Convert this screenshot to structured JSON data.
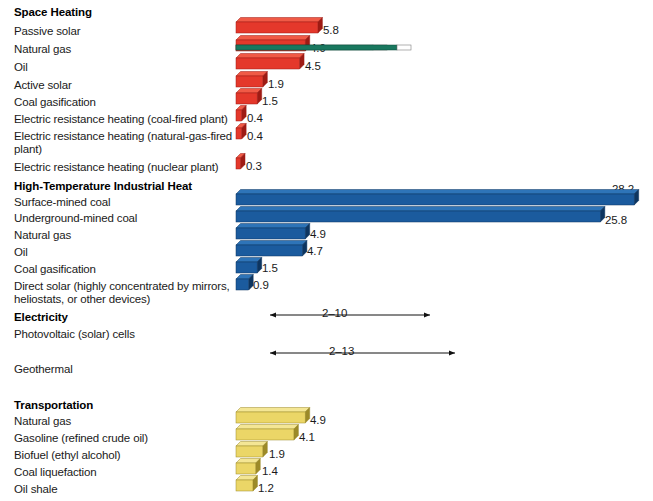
{
  "figure": {
    "title": "",
    "bar_start_x": 236,
    "px_per_unit": 14.12
  },
  "chart_data": {
    "type": "bar",
    "orientation": "horizontal",
    "title": "",
    "xlabel": "",
    "ylabel": "",
    "grid": false,
    "legend": "none",
    "xlim": [
      0,
      28.2
    ],
    "groups": [
      {
        "name": "Space Heating",
        "color": "#E4382B",
        "categories": [
          "Passive solar",
          "Natural gas",
          "Oil",
          "Active solar",
          "Coal gasification",
          "Electric resistance heating (coal-fired plant)",
          "Electric resistance heating (natural-gas-fired plant)",
          "Electric resistance heating (nuclear plant)"
        ],
        "values": [
          5.8,
          4.9,
          4.5,
          1.9,
          1.5,
          0.4,
          0.4,
          0.3
        ],
        "value_labels": [
          "5.8",
          "4.9",
          "4.5",
          "1.9",
          "1.5",
          "0.4",
          "0.4",
          "0.3"
        ]
      },
      {
        "name": "High-Temperature Industrial Heat",
        "color": "#1B5B9E",
        "categories": [
          "Surface-mined coal",
          "Underground-mined coal",
          "Natural gas",
          "Oil",
          "Coal gasification",
          "Direct solar (highly concentrated by mirrors, heliostats, or other devices)"
        ],
        "values": [
          28.2,
          25.8,
          4.9,
          4.7,
          1.5,
          0.9
        ],
        "value_labels": [
          "28.2",
          "25.8",
          "4.9",
          "4.7",
          "1.5",
          "0.9"
        ]
      },
      {
        "name": "Electricity",
        "color": "#19785F",
        "range_fill": "#ffffff",
        "categories": [
          "Photovoltaic (solar) cells",
          "Geothermal"
        ],
        "ranges": [
          [
            2,
            10
          ],
          [
            2,
            13
          ]
        ],
        "range_labels": [
          "2–10",
          "2–13"
        ]
      },
      {
        "name": "Transportation",
        "color": "#EBD667",
        "categories": [
          "Natural gas",
          "Gasoline (refined crude oil)",
          "Biofuel (ethyl alcohol)",
          "Coal liquefaction",
          "Oil shale"
        ],
        "values": [
          4.9,
          4.1,
          1.9,
          1.4,
          1.2
        ],
        "value_labels": [
          "4.9",
          "4.1",
          "1.9",
          "1.4",
          "1.2"
        ]
      }
    ]
  },
  "sections": {
    "space_heating": {
      "title": "Space Heating",
      "rows": [
        {
          "label": "Passive solar",
          "value": "5.8"
        },
        {
          "label": "Natural gas",
          "value": "4.9"
        },
        {
          "label": "Oil",
          "value": "4.5"
        },
        {
          "label": "Active solar",
          "value": "1.9"
        },
        {
          "label": "Coal gasification",
          "value": "1.5"
        },
        {
          "label": "Electric resistance heating (coal-fired plant)",
          "value": "0.4"
        },
        {
          "label": "Electric resistance heating (natural-gas-fired plant)",
          "value": "0.4"
        },
        {
          "label": "Electric resistance heating (nuclear plant)",
          "value": "0.3"
        }
      ]
    },
    "industrial_heat": {
      "title": "High-Temperature Industrial Heat",
      "rows": [
        {
          "label": "Surface-mined coal",
          "value": "28.2"
        },
        {
          "label": "Underground-mined coal",
          "value": "25.8"
        },
        {
          "label": "Natural gas",
          "value": "4.9"
        },
        {
          "label": "Oil",
          "value": "4.7"
        },
        {
          "label": "Coal gasification",
          "value": "1.5"
        },
        {
          "label": "Direct solar (highly concentrated by mirrors, heliostats, or other devices)",
          "value": "0.9"
        }
      ]
    },
    "electricity": {
      "title": "Electricity",
      "rows": [
        {
          "label": "Photovoltaic (solar) cells",
          "value": "2–10"
        },
        {
          "label": "Geothermal",
          "value": "2–13"
        }
      ]
    },
    "transportation": {
      "title": "Transportation",
      "rows": [
        {
          "label": "Natural gas",
          "value": "4.9"
        },
        {
          "label": "Gasoline (refined crude oil)",
          "value": "4.1"
        },
        {
          "label": "Biofuel (ethyl alcohol)",
          "value": "1.9"
        },
        {
          "label": "Coal liquefaction",
          "value": "1.4"
        },
        {
          "label": "Oil shale",
          "value": "1.2"
        }
      ]
    }
  },
  "colors": {
    "red_face": "#E4382B",
    "red_top": "#F05A46",
    "red_side": "#9E1B14",
    "blue_face": "#1B5B9E",
    "blue_top": "#2E74B8",
    "blue_side": "#0D3560",
    "green_face": "#19785F",
    "green_top": "#2C9277",
    "green_side": "#0D4738",
    "white_face": "#FFFFFF",
    "white_top": "#FFFFFF",
    "white_side": "#B8B8B8",
    "yellow_face": "#EBD667",
    "yellow_top": "#F4E694",
    "yellow_side": "#9C8A28",
    "text": "#1a1a1a"
  }
}
